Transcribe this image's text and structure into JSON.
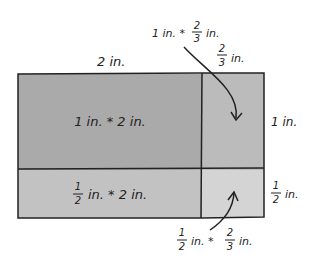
{
  "diagram": {
    "colors": {
      "top_left": "#aaaaaa",
      "top_right": "#bbbbbb",
      "bottom_left": "#c2c2c2",
      "bottom_right": "#d4d4d4",
      "stroke": "#222222"
    },
    "top_width_label": {
      "whole": "2 in."
    },
    "right_width_label": {
      "num": "2",
      "den": "3",
      "unit": "in."
    },
    "height_top_label": {
      "whole": "1 in."
    },
    "height_bottom_label": {
      "num": "1",
      "den": "2",
      "unit": "in."
    },
    "cells": {
      "top_left": {
        "text": "1 in. * 2 in."
      },
      "bottom_left": {
        "num": "1",
        "den": "2",
        "rest": "in. * 2 in."
      }
    },
    "callouts": {
      "top": {
        "prefix": "1 in. *",
        "num": "2",
        "den": "3",
        "unit": "in."
      },
      "bottom": {
        "num1": "1",
        "den1": "2",
        "mid": "in. *",
        "num2": "2",
        "den2": "3",
        "unit": "in."
      }
    }
  }
}
